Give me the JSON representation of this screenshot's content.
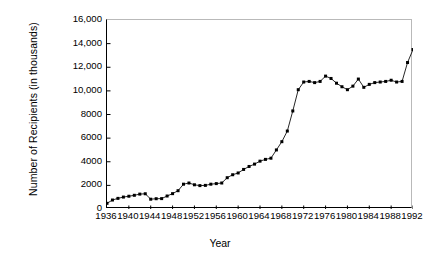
{
  "chart_data": {
    "type": "line",
    "title": "",
    "xlabel": "Year",
    "ylabel": "Number of Recipients (in thousands)",
    "xlim": [
      1936,
      1992
    ],
    "ylim": [
      0,
      16000
    ],
    "grid": false,
    "legend": null,
    "marker": "square",
    "marker_color": "#000000",
    "line_color": "#000000",
    "y_ticks": [
      0,
      2000,
      4000,
      6000,
      8000,
      10000,
      12000,
      14000,
      16000
    ],
    "y_tick_labels": [
      "0",
      "2000",
      "4000",
      "6000",
      "8000",
      "10,000",
      "12,000",
      "14,000",
      "16,000"
    ],
    "x_ticks": [
      1936,
      1940,
      1944,
      1948,
      1952,
      1956,
      1960,
      1964,
      1968,
      1972,
      1976,
      1980,
      1984,
      1988,
      1992
    ],
    "x_tick_labels": [
      "1936",
      "1940",
      "1944",
      "1948",
      "1952",
      "1956",
      "1960",
      "1964",
      "1968",
      "1972",
      "1976",
      "1980",
      "1984",
      "1988",
      "1992"
    ],
    "x": [
      1936,
      1937,
      1938,
      1939,
      1940,
      1941,
      1942,
      1943,
      1944,
      1945,
      1946,
      1947,
      1948,
      1949,
      1950,
      1951,
      1952,
      1953,
      1954,
      1955,
      1956,
      1957,
      1958,
      1959,
      1960,
      1961,
      1962,
      1963,
      1964,
      1965,
      1966,
      1967,
      1968,
      1969,
      1970,
      1971,
      1972,
      1973,
      1974,
      1975,
      1976,
      1977,
      1978,
      1979,
      1980,
      1981,
      1982,
      1983,
      1984,
      1985,
      1986,
      1987,
      1988,
      1989,
      1990,
      1991,
      1992
    ],
    "values": [
      480,
      760,
      900,
      1010,
      1080,
      1160,
      1260,
      1290,
      830,
      870,
      880,
      1100,
      1300,
      1550,
      2100,
      2200,
      2050,
      1980,
      2000,
      2100,
      2150,
      2200,
      2650,
      2900,
      3050,
      3350,
      3600,
      3800,
      4050,
      4200,
      4300,
      5000,
      5700,
      6600,
      8300,
      10100,
      10750,
      10800,
      10700,
      10800,
      11250,
      11050,
      10650,
      10350,
      10100,
      10400,
      11000,
      10300,
      10550,
      10700,
      10750,
      10800,
      10900,
      10750,
      10800,
      12400,
      13500
    ],
    "series_name": "Number of Recipients",
    "units": "thousands"
  }
}
